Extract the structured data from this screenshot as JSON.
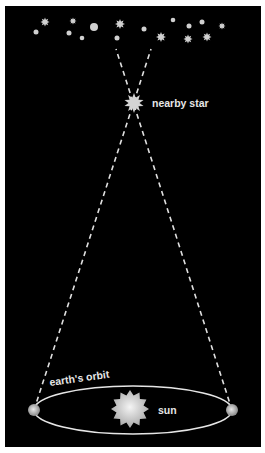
{
  "labels": {
    "nearby_star": "nearby star",
    "earths_orbit": "earth's orbit",
    "sun": "sun"
  },
  "colors": {
    "background": "#000000",
    "frame": "#ffffff",
    "line": "#e0e0e0",
    "star": "#d0d0d0"
  },
  "background_stars": [
    {
      "x": 45,
      "y": 22,
      "type": "star",
      "r": 4.5
    },
    {
      "x": 36,
      "y": 32,
      "type": "dot",
      "r": 2.5
    },
    {
      "x": 73,
      "y": 21,
      "type": "star",
      "r": 3.5
    },
    {
      "x": 69,
      "y": 33,
      "type": "dot",
      "r": 2.5
    },
    {
      "x": 94,
      "y": 27,
      "type": "dot",
      "r": 4
    },
    {
      "x": 82,
      "y": 38,
      "type": "dot",
      "r": 2.3
    },
    {
      "x": 120,
      "y": 24,
      "type": "star",
      "r": 5
    },
    {
      "x": 117,
      "y": 38,
      "type": "dot",
      "r": 2.5
    },
    {
      "x": 144,
      "y": 29,
      "type": "dot",
      "r": 2.5
    },
    {
      "x": 173,
      "y": 20,
      "type": "dot",
      "r": 2.3
    },
    {
      "x": 161,
      "y": 37,
      "type": "star",
      "r": 5
    },
    {
      "x": 189,
      "y": 26,
      "type": "dot",
      "r": 2.5
    },
    {
      "x": 188,
      "y": 39,
      "type": "star",
      "r": 4.5
    },
    {
      "x": 202,
      "y": 22,
      "type": "dot",
      "r": 2.5
    },
    {
      "x": 207,
      "y": 37,
      "type": "star",
      "r": 4.5
    },
    {
      "x": 222,
      "y": 26,
      "type": "star",
      "r": 3.5
    }
  ]
}
